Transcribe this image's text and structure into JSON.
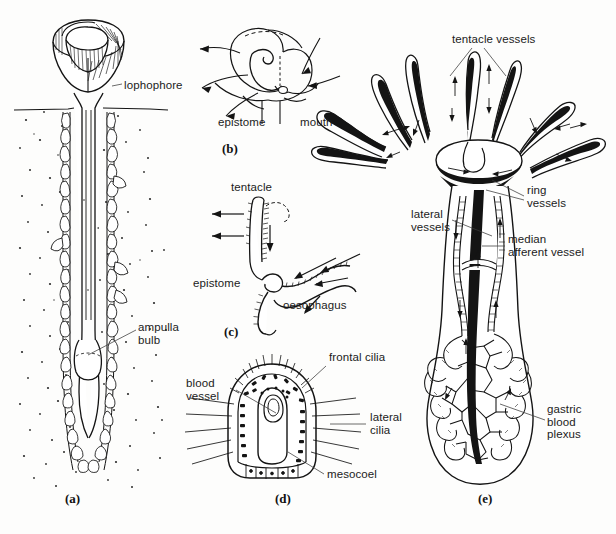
{
  "figure": {
    "background": "#fdfdfc",
    "ink_color": "#141414",
    "width": 616,
    "height": 534
  },
  "panels": [
    {
      "id": "a",
      "caption": "(a)",
      "caption_x": 73,
      "caption_y": 498,
      "description": "whole animal in sediment burrow",
      "labels": [
        {
          "text": "lophophore",
          "x": 124,
          "y": 85,
          "align": "left"
        },
        {
          "text": "ampulla\nbulb",
          "x": 138,
          "y": 327,
          "align": "left"
        }
      ]
    },
    {
      "id": "b",
      "caption": "(b)",
      "caption_x": 225,
      "caption_y": 141,
      "description": "lophophore feeding currents",
      "labels": [
        {
          "text": "epistome",
          "x": 218,
          "y": 122,
          "align": "left"
        },
        {
          "text": "mouth",
          "x": 300,
          "y": 122,
          "align": "left"
        }
      ]
    },
    {
      "id": "c",
      "caption": "(c)",
      "caption_x": 227,
      "caption_y": 325,
      "description": "tentacle, epistome and oesophagus with food currents",
      "labels": [
        {
          "text": "tentacle",
          "x": 231,
          "y": 186,
          "align": "left"
        },
        {
          "text": "epistome",
          "x": 195,
          "y": 282,
          "align": "left"
        },
        {
          "text": "oesophagus",
          "x": 283,
          "y": 304,
          "align": "left"
        }
      ]
    },
    {
      "id": "d",
      "caption": "(d)",
      "caption_x": 282,
      "caption_y": 498,
      "description": "transverse section of a tentacle",
      "labels": [
        {
          "text": "blood\nvessel",
          "x": 186,
          "y": 383,
          "align": "left"
        },
        {
          "text": "frontal cilia",
          "x": 329,
          "y": 356,
          "align": "left"
        },
        {
          "text": "lateral\ncilia",
          "x": 370,
          "y": 416,
          "align": "left"
        },
        {
          "text": "mesocoel",
          "x": 327,
          "y": 478,
          "align": "left"
        }
      ]
    },
    {
      "id": "e",
      "caption": "(e)",
      "caption_x": 485,
      "caption_y": 498,
      "description": "blood vascular system of whole animal",
      "labels": [
        {
          "text": "tentacle vessels",
          "x": 452,
          "y": 38,
          "align": "left"
        },
        {
          "text": "ring\nvessels",
          "x": 527,
          "y": 189,
          "align": "left"
        },
        {
          "text": "lateral\nvessels",
          "x": 413,
          "y": 213,
          "align": "left"
        },
        {
          "text": "median\nafferent vessel",
          "x": 508,
          "y": 238,
          "align": "left"
        },
        {
          "text": "gastric\nblood\nplexus",
          "x": 547,
          "y": 410,
          "align": "left"
        }
      ]
    }
  ],
  "terms": [
    "lophophore",
    "ampulla bulb",
    "epistome",
    "mouth",
    "tentacle",
    "oesophagus",
    "blood vessel",
    "frontal cilia",
    "lateral cilia",
    "mesocoel",
    "tentacle vessels",
    "ring vessels",
    "lateral vessels",
    "median afferent vessel",
    "gastric blood plexus"
  ]
}
